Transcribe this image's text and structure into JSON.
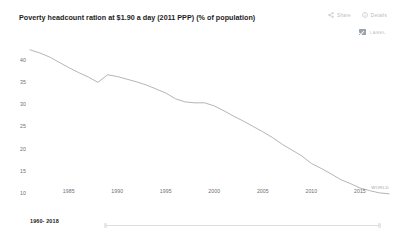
{
  "header": {
    "title": "Poverty headcount ration at $1.90 a day (2011 PPP) (% of population)",
    "share_label": "Share",
    "details_label": "Details",
    "share_icon": "share-icon",
    "details_icon": "info-icon"
  },
  "controls": {
    "label_toggle_text": "LABEL",
    "label_toggle_checked": "true"
  },
  "footer": {
    "range_text": "1960- 2018"
  },
  "chart_data": {
    "type": "line",
    "title": "Poverty headcount ration at $1.90 a day (2011 PPP) (% of population)",
    "xlabel": "",
    "ylabel": "",
    "xlim": [
      1981,
      2018
    ],
    "ylim": [
      8.5,
      43.5
    ],
    "grid": false,
    "legend_position": "inline-end",
    "line_color": "#9c9c9c",
    "series_label": "WORLD",
    "y_ticks": [
      40,
      35,
      30,
      25,
      20,
      15,
      10
    ],
    "x_ticks": [
      1985,
      1990,
      1995,
      2000,
      2005,
      2010,
      2015
    ],
    "series": [
      {
        "name": "WORLD",
        "x": [
          1981,
          1982,
          1983,
          1984,
          1985,
          1986,
          1987,
          1988,
          1989,
          1990,
          1991,
          1992,
          1993,
          1994,
          1995,
          1996,
          1997,
          1998,
          1999,
          2000,
          2001,
          2002,
          2003,
          2004,
          2005,
          2006,
          2007,
          2008,
          2009,
          2010,
          2011,
          2012,
          2013,
          2014,
          2015,
          2016,
          2017,
          2018
        ],
        "values": [
          42.2,
          41.5,
          40.6,
          39.4,
          38.2,
          37.1,
          36.1,
          34.9,
          36.6,
          36.2,
          35.6,
          35.0,
          34.3,
          33.4,
          32.5,
          31.2,
          30.5,
          30.3,
          30.3,
          29.6,
          28.5,
          27.3,
          26.2,
          25.0,
          23.8,
          22.5,
          21.0,
          19.7,
          18.4,
          16.7,
          15.6,
          14.4,
          13.1,
          12.2,
          11.2,
          10.6,
          10.1,
          9.9
        ]
      }
    ]
  }
}
